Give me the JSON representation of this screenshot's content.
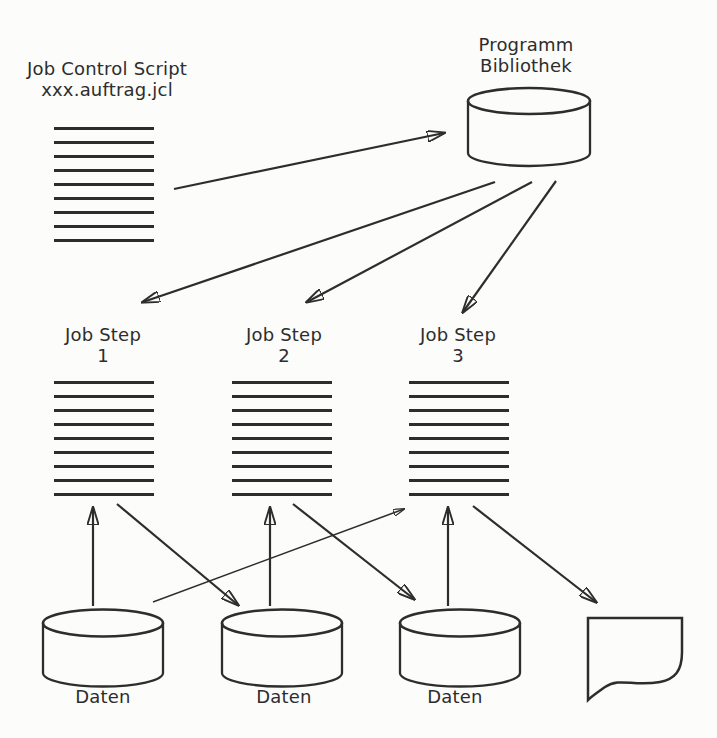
{
  "figure": {
    "type": "flow-diagram",
    "topic": "JCL job control flow: a job control script references a program library; the library invokes three job steps which read and write data stores and emit a document"
  },
  "job_control": {
    "title": "Job Control Script",
    "subtitle": "xxx.auftrag.jcl"
  },
  "library": {
    "name_line1": "Programm",
    "name_line2": "Bibliothek"
  },
  "job_steps": [
    {
      "title": "Job Step",
      "number": "1"
    },
    {
      "title": "Job Step",
      "number": "2"
    },
    {
      "title": "Job Step",
      "number": "3"
    }
  ],
  "data_stores": [
    {
      "label": "Daten"
    },
    {
      "label": "Daten"
    },
    {
      "label": "Daten"
    }
  ],
  "edges": [
    {
      "from": "job-control-script",
      "to": "program-library",
      "style": "normal"
    },
    {
      "from": "program-library",
      "to": "job-step-1",
      "style": "normal"
    },
    {
      "from": "program-library",
      "to": "job-step-2",
      "style": "normal"
    },
    {
      "from": "program-library",
      "to": "job-step-3",
      "style": "normal"
    },
    {
      "from": "daten-1",
      "to": "job-step-1",
      "style": "normal"
    },
    {
      "from": "job-step-1",
      "to": "daten-2",
      "style": "normal"
    },
    {
      "from": "daten-1",
      "to": "job-step-3",
      "style": "thin"
    },
    {
      "from": "daten-2",
      "to": "job-step-2",
      "style": "normal"
    },
    {
      "from": "job-step-2",
      "to": "daten-3",
      "style": "normal"
    },
    {
      "from": "daten-3",
      "to": "job-step-3",
      "style": "normal"
    },
    {
      "from": "job-step-3",
      "to": "document",
      "style": "normal"
    }
  ],
  "colors": {
    "ink": "#2d2d2d",
    "paper": "#fcfcfa"
  }
}
